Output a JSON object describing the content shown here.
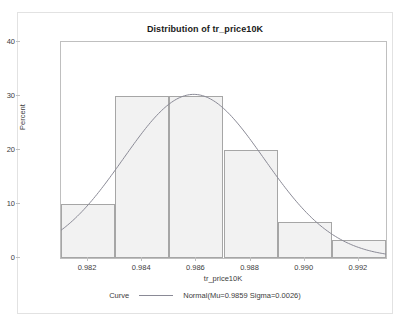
{
  "chart_data": {
    "type": "bar",
    "title": "Distribution of tr_price10K",
    "xlabel": "tr_price10K",
    "ylabel": "Percent",
    "categories": [
      "0.982",
      "0.984",
      "0.986",
      "0.988",
      "0.990",
      "0.992"
    ],
    "bin_edges": [
      0.981,
      0.983,
      0.985,
      0.987,
      0.989,
      0.991,
      0.993
    ],
    "values": [
      10,
      30,
      30,
      20,
      6.7,
      3.3
    ],
    "xlim": [
      0.981,
      0.993
    ],
    "ylim": [
      0,
      40
    ],
    "x_ticks": [
      "0.982",
      "0.984",
      "0.986",
      "0.988",
      "0.990",
      "0.992"
    ],
    "y_ticks": [
      "0",
      "10",
      "20",
      "30",
      "40"
    ],
    "grid": false,
    "legend_position": "bottom",
    "series": [
      {
        "name": "Normal(Mu=0.9859 Sigma=0.0026)",
        "type": "line",
        "mu": 0.9859,
        "sigma": 0.0026,
        "peak_percent": 30.3
      }
    ],
    "colors": {
      "bar_fill": "#f2f2f2",
      "bar_border": "#a6a6a6",
      "curve": "#8a8a96",
      "axis": "#bfbfbf",
      "text": "#3c3c3c",
      "frame": "#e2e2e2",
      "background": "#ffffff"
    }
  },
  "legend": {
    "group_label": "Curve",
    "entry_label": "Normal(Mu=0.9859 Sigma=0.0026)"
  }
}
